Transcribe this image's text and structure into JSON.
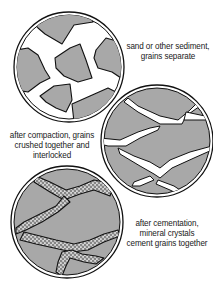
{
  "colors": {
    "grain": "#a8a8a8",
    "outline": "#111111",
    "pore_space": "#ffffff",
    "cement_dots": "#222222"
  },
  "stages": [
    {
      "name": "loose-sediment",
      "label_lines": [
        "sand or other sediment,",
        "grains separate"
      ]
    },
    {
      "name": "compaction",
      "label_lines": [
        "after compaction, grains",
        "crushed together and",
        "interlocked"
      ]
    },
    {
      "name": "cementation",
      "label_lines": [
        "after cementation,",
        "mineral crystals",
        "cement grains together"
      ]
    }
  ]
}
